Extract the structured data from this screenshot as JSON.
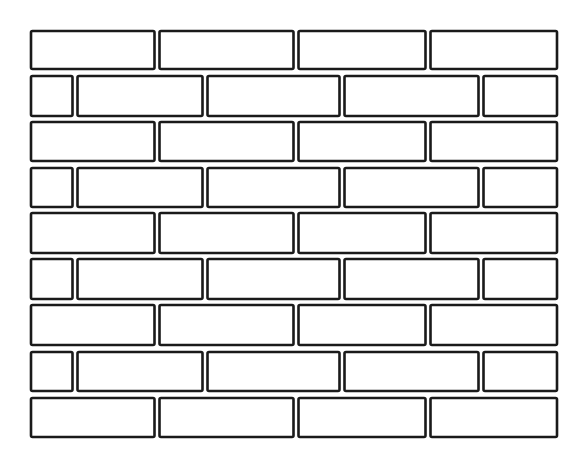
{
  "illustration": {
    "subject": "brick wall",
    "style": "black line art on white",
    "colors": {
      "background": "#ffffff",
      "line": "#1a1a1a"
    },
    "rows": [
      {
        "pattern": "full",
        "bricks": 4
      },
      {
        "pattern": "offset",
        "bricks": 5
      },
      {
        "pattern": "full",
        "bricks": 4
      },
      {
        "pattern": "offset",
        "bricks": 5
      },
      {
        "pattern": "full",
        "bricks": 4
      },
      {
        "pattern": "offset",
        "bricks": 5
      },
      {
        "pattern": "full",
        "bricks": 4
      },
      {
        "pattern": "offset",
        "bricks": 5
      },
      {
        "pattern": "full",
        "bricks": 4
      }
    ]
  }
}
